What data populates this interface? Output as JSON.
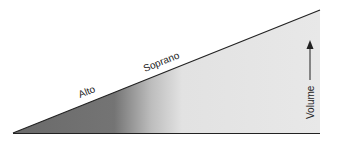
{
  "diagram": {
    "labels": {
      "alto": "Alto",
      "soprano": "Soprano",
      "volume": "Volume"
    },
    "colors": {
      "dark_fill": "#6e6e6e",
      "light_fill": "#e6e6e6",
      "line": "#222222"
    }
  }
}
